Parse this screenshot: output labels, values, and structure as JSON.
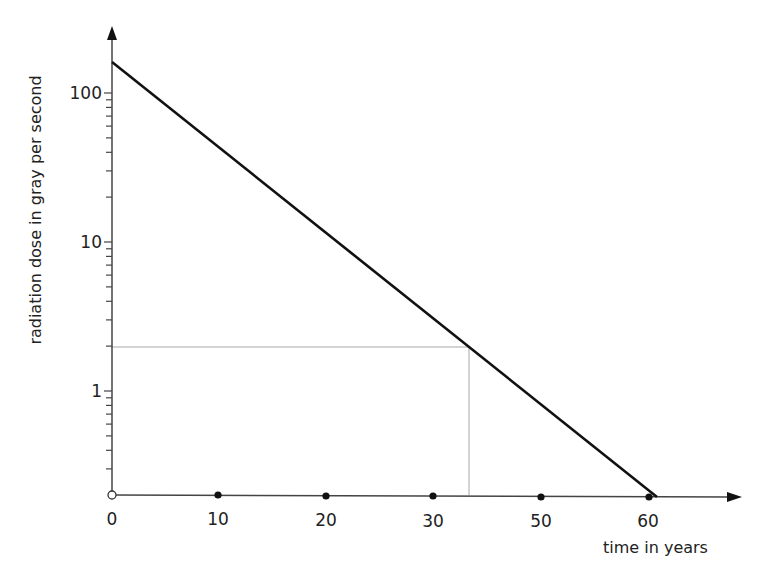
{
  "chart_data": {
    "type": "line",
    "title": "",
    "xlabel": "time in years",
    "ylabel": "radiation dose in gray per second",
    "yscale": "log",
    "ylim": [
      0.2,
      200
    ],
    "xlim": [
      0,
      68
    ],
    "grid": false,
    "legend": null,
    "x_tick_labels": [
      "0",
      "10",
      "20",
      "30",
      "50",
      "60"
    ],
    "x_tick_positions_px": [
      112,
      218,
      326,
      433,
      541,
      649
    ],
    "y_tick_labels": [
      "100",
      "10",
      "1"
    ],
    "y_tick_values": [
      100,
      10,
      1
    ],
    "series": [
      {
        "name": "dose",
        "color": "#111111",
        "points": [
          {
            "x": 0,
            "y": 160
          },
          {
            "x": 61,
            "y": 0.2
          }
        ]
      }
    ],
    "annotations": [
      {
        "type": "hline-guide",
        "y": 2,
        "from_x": 0,
        "to_x": 33,
        "color": "#9a9a9a"
      },
      {
        "type": "vline-guide",
        "x": 33,
        "from_y": 0.2,
        "to_y": 2,
        "color": "#9a9a9a"
      },
      {
        "type": "open-circle",
        "x": 0,
        "y": 0.2,
        "note": "origin marker"
      }
    ],
    "x_markers": "filled dots at each labeled x tick except origin (open circle)"
  }
}
